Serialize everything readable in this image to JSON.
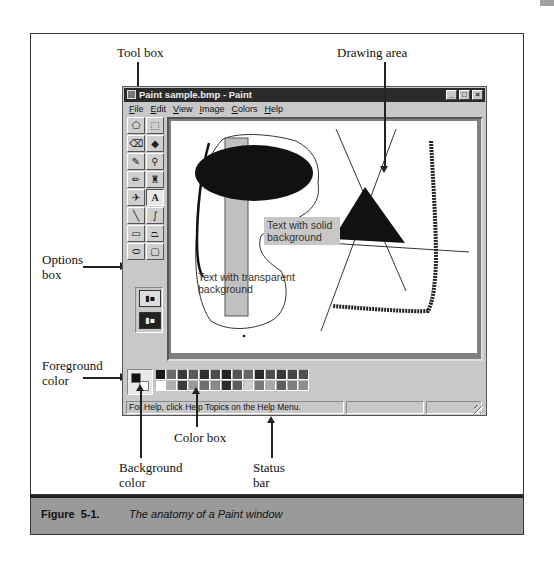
{
  "figure": {
    "number": "Figure  5-1.",
    "caption": "The anatomy of a Paint window"
  },
  "callouts": {
    "tool_box": "Tool box",
    "drawing_area": "Drawing area",
    "options_box_line1": "Options",
    "options_box_line2": "box",
    "foreground_line1": "Foreground",
    "foreground_line2": "color",
    "color_box": "Color box",
    "background_line1": "Background",
    "background_line2": "color",
    "status_line1": "Status",
    "status_line2": "bar"
  },
  "window": {
    "title": "Paint sample.bmp - Paint",
    "buttons": {
      "minimize": "_",
      "maximize": "□",
      "close": "×"
    },
    "menu": [
      "File",
      "Edit",
      "View",
      "Image",
      "Colors",
      "Help"
    ]
  },
  "toolbox": {
    "tools": [
      {
        "name": "free-form-select",
        "glyph": "⬠"
      },
      {
        "name": "select",
        "glyph": "⬚"
      },
      {
        "name": "eraser",
        "glyph": "⌫"
      },
      {
        "name": "fill-with-color",
        "glyph": "◆"
      },
      {
        "name": "pick-color",
        "glyph": "✎"
      },
      {
        "name": "magnifier",
        "glyph": "⚲"
      },
      {
        "name": "pencil",
        "glyph": "✏"
      },
      {
        "name": "brush",
        "glyph": "♜"
      },
      {
        "name": "airbrush",
        "glyph": "✈"
      },
      {
        "name": "text",
        "glyph": "A"
      },
      {
        "name": "line",
        "glyph": "╲"
      },
      {
        "name": "curve",
        "glyph": "∫"
      },
      {
        "name": "rectangle",
        "glyph": "▭"
      },
      {
        "name": "polygon",
        "glyph": "⏢"
      },
      {
        "name": "ellipse",
        "glyph": "⬭"
      },
      {
        "name": "rounded-rectangle",
        "glyph": "▢"
      }
    ],
    "options": {
      "opaque": "▮▪",
      "transparent": "▮▪"
    }
  },
  "canvas": {
    "text_solid_line1": "Text with solid",
    "text_solid_line2": "background",
    "text_transparent_line1": "Text with transparent",
    "text_transparent_line2": "background"
  },
  "palette": {
    "foreground": "#111111",
    "background": "#ffffff",
    "colors": [
      "#1a1a1a",
      "#6a6a6a",
      "#3a3a3a",
      "#5a5a5a",
      "#2e2e2e",
      "#4a4a4a",
      "#222222",
      "#555555",
      "#666666",
      "#2a2a2a",
      "#4e4e4e",
      "#383838",
      "#444444",
      "#505050",
      "#ffffff",
      "#b0b0b0",
      "#3c3c3c",
      "#9a9a9a",
      "#6e6e6e",
      "#888888",
      "#2c2c2c",
      "#5c5c5c",
      "#cfcfcf",
      "#7a7a7a",
      "#a8a8a8",
      "#5e5e5e",
      "#7e7e7e",
      "#8e8e8e"
    ]
  },
  "statusbar": {
    "message": "For Help, click Help Topics on the Help Menu.",
    "pane2": "",
    "pane3": ""
  }
}
